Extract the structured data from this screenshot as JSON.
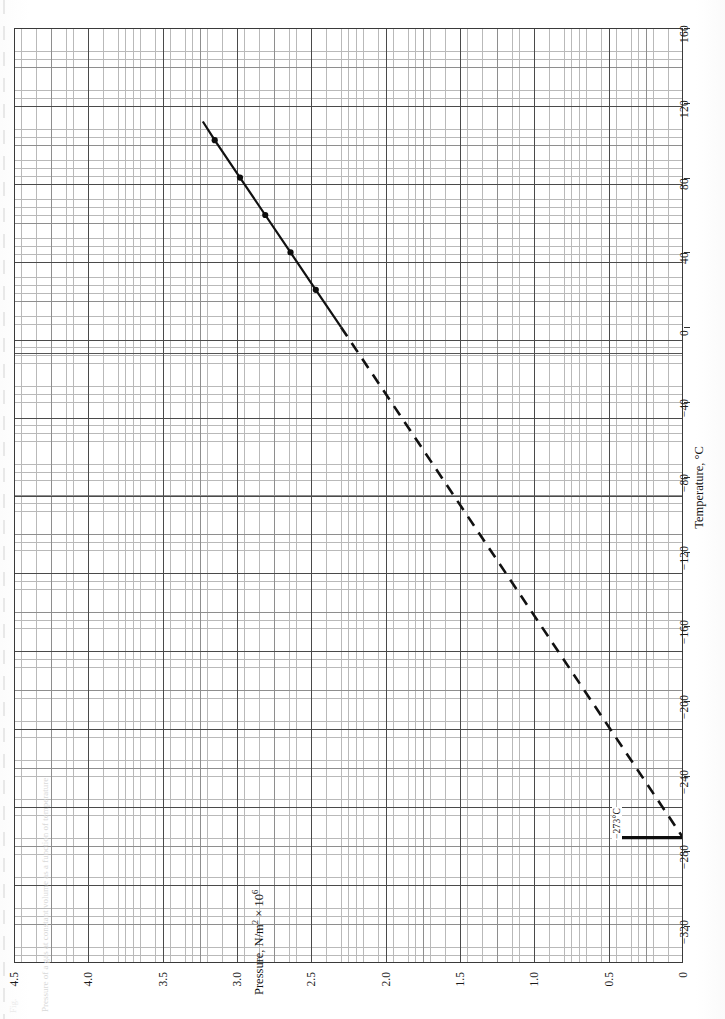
{
  "figure": {
    "caption_label": "Fig.",
    "caption_text": "Pressure of a gas at constant volume as a function of temperature"
  },
  "axes": {
    "x": {
      "title": "Temperature, °C",
      "unit": "°C",
      "min": -340,
      "max": 160,
      "major_step": 40,
      "ticks": [
        160,
        120,
        80,
        40,
        0,
        -40,
        -80,
        -120,
        -160,
        -200,
        -240,
        -280,
        -320
      ],
      "tick_labels": [
        "160",
        "120",
        "80",
        "40",
        "0",
        "−40",
        "−80",
        "−120",
        "−160",
        "−200",
        "−240",
        "−280",
        "−320"
      ]
    },
    "y": {
      "title_main": "Pressure, N/m",
      "title_sup1": "2",
      "title_mul": " × 10",
      "title_sup2": "6",
      "title": "Pressure, N/m2 × 106",
      "min": 0,
      "max": 4.5,
      "major_step": 0.5,
      "ticks": [
        4.5,
        4.0,
        3.5,
        3.0,
        2.5,
        2.0,
        1.5,
        1.0,
        0.5,
        0
      ],
      "tick_labels": [
        "4.5",
        "4.0",
        "3.5",
        "3.0",
        "2.5",
        "2.0",
        "1.5",
        "1.0",
        "0.5",
        "0"
      ]
    }
  },
  "annotations": [
    {
      "id": "absolute-zero",
      "text": "−273°C",
      "temperature": -273,
      "pressure": 0
    }
  ],
  "chart_data": {
    "type": "line",
    "title": "",
    "xlabel": "Temperature, °C",
    "ylabel": "Pressure, N/m2 × 106",
    "xlim": [
      -340,
      160
    ],
    "ylim": [
      0,
      4.5
    ],
    "grid": true,
    "legend": false,
    "legend_position": "none",
    "series": [
      {
        "name": "measured data",
        "style": "solid-with-markers",
        "x": [
          0,
          20,
          40,
          60,
          80,
          100,
          110
        ],
        "y": [
          2.3,
          2.47,
          2.64,
          2.81,
          2.98,
          3.15,
          3.23
        ]
      },
      {
        "name": "extrapolation to absolute zero",
        "style": "dashed",
        "x": [
          0,
          -273
        ],
        "y": [
          2.3,
          0.0
        ]
      }
    ],
    "data_points": [
      {
        "x": 20,
        "y": 2.47
      },
      {
        "x": 40,
        "y": 2.64
      },
      {
        "x": 60,
        "y": 2.81
      },
      {
        "x": 80,
        "y": 2.98
      },
      {
        "x": 100,
        "y": 3.15
      }
    ],
    "annotations": [
      {
        "text": "−273°C",
        "x": -273,
        "y": 0
      }
    ]
  }
}
